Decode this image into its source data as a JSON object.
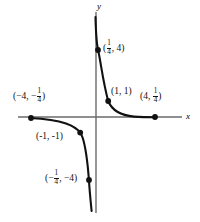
{
  "figure": {
    "type": "graph",
    "function": "y = 1/x",
    "axes": {
      "x_label": "x",
      "y_label": "y",
      "x_axis_y_px": 117,
      "y_axis_x_px": 96,
      "color": "#555555"
    },
    "curve_color": "#111111",
    "point_color": "#111111",
    "points": [
      {
        "id": "p-quarter-four",
        "label_text": "(1/4, 4)",
        "x": 0.25,
        "y": 4,
        "px": 98,
        "py": 50,
        "label_px": 103,
        "label_py": 43,
        "parts": {
          "open": "(",
          "num": "1",
          "den": "4",
          "mid": ", ",
          "second": "4",
          "close": ")"
        }
      },
      {
        "id": "p-one-one",
        "label_text": "(1, 1)",
        "x": 1,
        "y": 1,
        "px": 108,
        "py": 101,
        "label_px": 111,
        "label_py": 89
      },
      {
        "id": "p-four-quarter",
        "label_text": "(4, 1/4)",
        "x": 4,
        "y": 0.25,
        "px": 155,
        "py": 117,
        "label_px": 140,
        "label_py": 90,
        "parts": {
          "open": "(",
          "first": "4",
          "mid": ", ",
          "num": "1",
          "den": "4",
          "close": ")"
        }
      },
      {
        "id": "p-neg-four-neg-quarter",
        "label_text": "(-4, -1/4)",
        "x": -4,
        "y": -0.25,
        "px": 31,
        "py": 118,
        "label_px": 13,
        "label_py": 90,
        "parts": {
          "open": "(",
          "first": "−4",
          "mid": ", ",
          "sign": "−",
          "num": "1",
          "den": "4",
          "close": ")"
        }
      },
      {
        "id": "p-neg-one-neg-one",
        "label_text": "(-1, -1)",
        "x": -1,
        "y": -1,
        "px": 80,
        "py": 132,
        "label_px": 36,
        "label_py": 134
      },
      {
        "id": "p-neg-quarter-neg-four",
        "label_text": "(-1/4, -4)",
        "x": -0.25,
        "y": -4,
        "px": 89,
        "py": 180,
        "label_px": 45,
        "label_py": 173,
        "parts": {
          "open": "(",
          "sign": "−",
          "num": "1",
          "den": "4",
          "mid": ", ",
          "second": "−4",
          "close": ")"
        }
      }
    ],
    "branches": [
      {
        "id": "branch-upper-right",
        "quadrant": 1,
        "path": "M 95.5,17 C 95.9,34 96.6,44 98.2,50.5 C 100.6,61 103,82 108.2,101 C 112,110.5 122,115.5 134,116.6 C 141,117.1 149,117.2 156,117.2"
      },
      {
        "id": "branch-lower-left",
        "quadrant": 3,
        "path": "M 30,118 C 43,118.6 56,120 66,123.5 C 73.5,126.2 77.5,129 80.2,132.6 C 84.2,138 86.2,152 87.8,167 C 88.6,175 89,180.5 89.5,188 C 90.1,196 90.8,203 91.6,211"
      }
    ]
  }
}
